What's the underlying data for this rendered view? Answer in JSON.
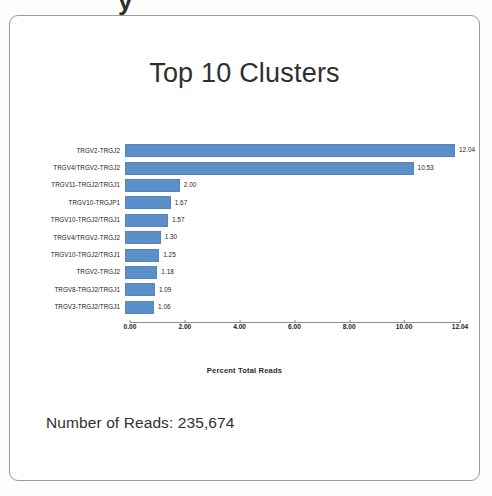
{
  "page": {
    "top_fragment": "y"
  },
  "figure": {
    "title": "Top 10 Clusters",
    "reads_note": "Number of Reads: 235,674"
  },
  "chart_data": {
    "type": "bar",
    "orientation": "horizontal",
    "title": "Top 10 Clusters",
    "xlabel": "Percent Total Reads",
    "ylabel": "",
    "grid": false,
    "legend": "none",
    "xlim": [
      0,
      12.04
    ],
    "bar_color": "#5b8fca",
    "categories": [
      "TRGV2-TRGJ2",
      "TRGV4/TRGV2-TRGJ2",
      "TRGV11-TRGJ2/TRGJ1",
      "TRGV10-TRGJP1",
      "TRGV10-TRGJ2/TRGJ1",
      "TRGV4/TRGV2-TRGJ2",
      "TRGV10-TRGJ2/TRGJ1",
      "TRGV2-TRGJ2",
      "TRGV8-TRGJ2/TRGJ1",
      "TRGV3-TRGJ2/TRGJ1"
    ],
    "values": [
      12.04,
      10.53,
      2.0,
      1.67,
      1.57,
      1.3,
      1.25,
      1.18,
      1.09,
      1.06
    ],
    "value_labels": [
      "12.04",
      "10.53",
      "2.00",
      "1.67",
      "1.57",
      "1.30",
      "1.25",
      "1.18",
      "1.09",
      "1.06"
    ],
    "xticks": [
      0,
      2,
      4,
      6,
      8,
      10,
      12.04
    ],
    "xtick_labels": [
      "0.00",
      "2.00",
      "4.00",
      "6.00",
      "8.00",
      "10.00",
      "12.04"
    ]
  }
}
